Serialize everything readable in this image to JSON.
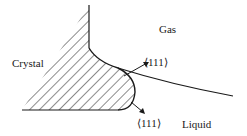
{
  "diagram": {
    "regions": {
      "crystal": "Crystal",
      "gas": "Gas",
      "liquid": "Liquid"
    },
    "facets": {
      "upper": "⟨111⟩",
      "lower": "⟨111⟩"
    },
    "colors": {
      "line": "#1a1a1a",
      "background": "#ffffff"
    }
  }
}
